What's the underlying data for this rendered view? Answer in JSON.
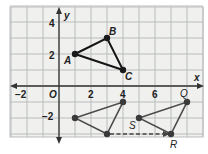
{
  "figure": {
    "type": "coordinate-plane-translation",
    "axes": {
      "x_label": "x",
      "y_label": "y",
      "origin_label": "O",
      "x_ticks": [
        {
          "value": -2,
          "label": "−2"
        },
        {
          "value": 2,
          "label": "2"
        },
        {
          "value": 4,
          "label": "4"
        },
        {
          "value": 6,
          "label": "6"
        }
      ],
      "y_ticks": [
        {
          "value": 4,
          "label": "4"
        },
        {
          "value": 2,
          "label": "2"
        },
        {
          "value": -2,
          "label": "−2"
        }
      ],
      "x_range": [
        -3,
        9
      ],
      "y_range": [
        -3,
        5
      ]
    },
    "colors": {
      "grid_background": "#f0f0ee",
      "grid_line": "#b9bcbd",
      "axis": "#333333",
      "triangle_abc": "#151515",
      "triangle_image": "#4a4a4a",
      "point": "#1a1a1a"
    },
    "triangles": [
      {
        "name": "triangle-abc",
        "vertices": [
          {
            "label": "A",
            "x": 1,
            "y": 2
          },
          {
            "label": "B",
            "x": 3,
            "y": 3
          },
          {
            "label": "C",
            "x": 4,
            "y": 1
          }
        ]
      },
      {
        "name": "triangle-intermediate",
        "vertices": [
          {
            "label": "",
            "x": 1,
            "y": -2
          },
          {
            "label": "",
            "x": 4,
            "y": -1
          },
          {
            "label": "",
            "x": 3,
            "y": -3
          }
        ]
      },
      {
        "name": "triangle-qrs",
        "vertices": [
          {
            "label": "S",
            "x": 5,
            "y": -2
          },
          {
            "label": "Q",
            "x": 8,
            "y": -1
          },
          {
            "label": "R",
            "x": 7,
            "y": -3
          }
        ]
      }
    ],
    "translation_arrow": {
      "from": {
        "x": 3,
        "y": -3
      },
      "to": {
        "x": 7,
        "y": -3
      },
      "style": "dashed"
    }
  }
}
